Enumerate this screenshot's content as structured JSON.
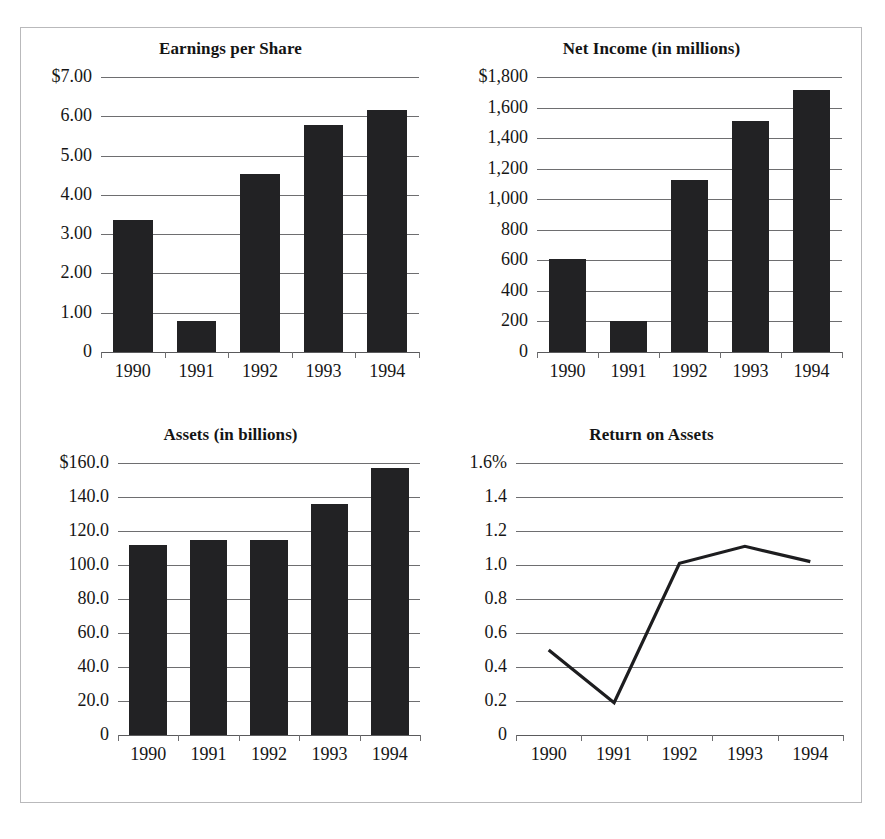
{
  "figure": {
    "background_color": "#ffffff",
    "frame_color": "#b9b9bb",
    "bar_color": "#222224",
    "grid_color": "#6e6e70",
    "text_color": "#161616",
    "categories": [
      "1990",
      "1991",
      "1992",
      "1993",
      "1994"
    ]
  },
  "panels": [
    {
      "id": "earnings-per-share",
      "title": "Earnings per Share",
      "y_ticks": [
        "$7.00",
        "6.00",
        "5.00",
        "4.00",
        "3.00",
        "2.00",
        "1.00",
        "0"
      ],
      "y_values": [
        7,
        6,
        5,
        4,
        3,
        2,
        1,
        0
      ]
    },
    {
      "id": "net-income",
      "title": "Net Income (in millions)",
      "y_ticks": [
        "$1,800",
        "1,600",
        "1,400",
        "1,200",
        "1,000",
        "800",
        "600",
        "400",
        "200",
        "0"
      ],
      "y_values": [
        1800,
        1600,
        1400,
        1200,
        1000,
        800,
        600,
        400,
        200,
        0
      ]
    },
    {
      "id": "assets",
      "title": "Assets (in billions)",
      "y_ticks": [
        "$160.0",
        "140.0",
        "120.0",
        "100.0",
        "80.0",
        "60.0",
        "40.0",
        "20.0",
        "0"
      ],
      "y_values": [
        160,
        140,
        120,
        100,
        80,
        60,
        40,
        20,
        0
      ]
    },
    {
      "id": "return-on-assets",
      "title": "Return on Assets",
      "y_ticks": [
        "1.6%",
        "1.4",
        "1.2",
        "1.0",
        "0.8",
        "0.6",
        "0.4",
        "0.2",
        "0"
      ],
      "y_values": [
        1.6,
        1.4,
        1.2,
        1.0,
        0.8,
        0.6,
        0.4,
        0.2,
        0
      ]
    }
  ],
  "chart_data": [
    {
      "type": "bar",
      "title": "Earnings per Share",
      "xlabel": "",
      "ylabel": "",
      "categories": [
        "1990",
        "1991",
        "1992",
        "1993",
        "1994"
      ],
      "values": [
        3.35,
        0.78,
        4.52,
        5.77,
        6.15
      ],
      "ylim": [
        0,
        7
      ],
      "ytick_labels": [
        "$7.00",
        "6.00",
        "5.00",
        "4.00",
        "3.00",
        "2.00",
        "1.00",
        "0"
      ],
      "ytick_values": [
        7,
        6,
        5,
        4,
        3,
        2,
        1,
        0
      ],
      "grid": true,
      "legend": "none"
    },
    {
      "type": "bar",
      "title": "Net Income (in millions)",
      "xlabel": "",
      "ylabel": "",
      "categories": [
        "1990",
        "1991",
        "1992",
        "1993",
        "1994"
      ],
      "values": [
        610,
        205,
        1125,
        1510,
        1715
      ],
      "ylim": [
        0,
        1800
      ],
      "ytick_labels": [
        "$1,800",
        "1,600",
        "1,400",
        "1,200",
        "1,000",
        "800",
        "600",
        "400",
        "200",
        "0"
      ],
      "ytick_values": [
        1800,
        1600,
        1400,
        1200,
        1000,
        800,
        600,
        400,
        200,
        0
      ],
      "grid": true,
      "legend": "none"
    },
    {
      "type": "bar",
      "title": "Assets (in billions)",
      "xlabel": "",
      "ylabel": "",
      "categories": [
        "1990",
        "1991",
        "1992",
        "1993",
        "1994"
      ],
      "values": [
        112.0,
        115.0,
        115.0,
        136.0,
        157.0
      ],
      "ylim": [
        0,
        160
      ],
      "ytick_labels": [
        "$160.0",
        "140.0",
        "120.0",
        "100.0",
        "80.0",
        "60.0",
        "40.0",
        "20.0",
        "0"
      ],
      "ytick_values": [
        160,
        140,
        120,
        100,
        80,
        60,
        40,
        20,
        0
      ],
      "grid": true,
      "legend": "none"
    },
    {
      "type": "line",
      "title": "Return on Assets",
      "xlabel": "",
      "ylabel": "",
      "categories": [
        "1990",
        "1991",
        "1992",
        "1993",
        "1994"
      ],
      "values": [
        0.5,
        0.19,
        1.01,
        1.11,
        1.02
      ],
      "ylim": [
        0,
        1.6
      ],
      "ytick_labels": [
        "1.6%",
        "1.4",
        "1.2",
        "1.0",
        "0.8",
        "0.6",
        "0.4",
        "0.2",
        "0"
      ],
      "ytick_values": [
        1.6,
        1.4,
        1.2,
        1.0,
        0.8,
        0.6,
        0.4,
        0.2,
        0
      ],
      "grid": true,
      "legend": "none"
    }
  ]
}
